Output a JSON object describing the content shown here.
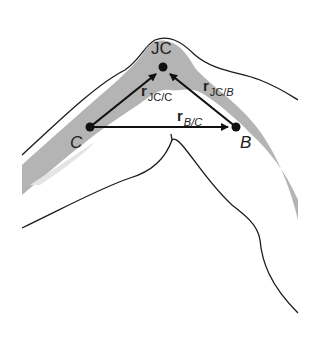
{
  "diagram": {
    "type": "joint-vector-diagram",
    "points": {
      "jc": {
        "label": "JC",
        "x": 163,
        "y": 67
      },
      "c": {
        "label": "C",
        "x": 90,
        "y": 127
      },
      "b": {
        "label": "B",
        "x": 236,
        "y": 127
      }
    },
    "vectors": [
      {
        "name": "r",
        "subscript_main": "JC/",
        "subscript_ref": "C",
        "from": "C",
        "to": "JC"
      },
      {
        "name": "r",
        "subscript_main": "JC/",
        "subscript_ref": "B",
        "from": "B",
        "to": "JC"
      },
      {
        "name": "r",
        "subscript_main": "",
        "subscript_ref": "B/C",
        "from": "C",
        "to": "B"
      }
    ],
    "colors": {
      "bone": "#b4b4b4",
      "outline": "#1a1a1a",
      "vector": "#111111",
      "background": "#ffffff"
    }
  }
}
